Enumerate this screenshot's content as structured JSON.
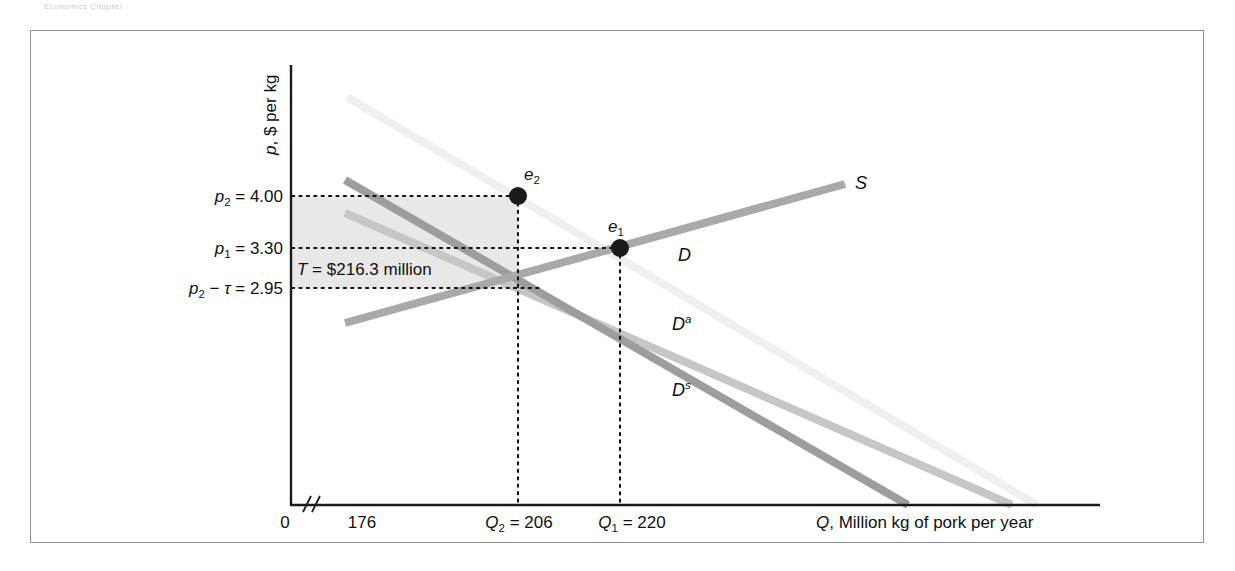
{
  "page": {
    "header_faint_text": "Economics  Chapter"
  },
  "chart_data": {
    "type": "line",
    "title": "",
    "xlabel": "Q, Million kg of pork per year",
    "ylabel": "p, $ per kg",
    "grid": false,
    "legend_position": "inline-curve-labels",
    "x_ticks": [
      {
        "label": "0",
        "value": 0
      },
      {
        "label": "176",
        "value": 176
      },
      {
        "label": "Q₂ = 206",
        "value": 206
      },
      {
        "label": "Q₁ = 220",
        "value": 220
      }
    ],
    "x_axis_break": true,
    "y_ticks": [
      {
        "label": "p₂ = 4.00",
        "value": 4.0
      },
      {
        "label": "p₁ = 3.30",
        "value": 3.3
      },
      {
        "label": "p₂ − τ = 2.95",
        "value": 2.95
      }
    ],
    "annotations": [
      {
        "name": "tax-revenue",
        "text": "T = $216.3 million",
        "value": 216.3,
        "units": "million dollars"
      },
      {
        "name": "equilibrium-2",
        "text": "e₂",
        "x": 206,
        "y": 4.0
      },
      {
        "name": "equilibrium-1",
        "text": "e₁",
        "x": 220,
        "y": 3.3
      }
    ],
    "series": [
      {
        "name": "S",
        "label": "S",
        "role": "supply",
        "color": "#a9a9a9",
        "points": [
          [
            176,
            2.62
          ],
          [
            292,
            4.16
          ]
        ]
      },
      {
        "name": "D",
        "label": "D",
        "role": "total-demand",
        "color": "#efefef",
        "points": [
          [
            182,
            5.22
          ],
          [
            360,
            1.05
          ]
        ]
      },
      {
        "name": "Da",
        "label": "D",
        "superscript": "a",
        "role": "domestic-demand",
        "color": "#c6c6c6",
        "points": [
          [
            176,
            4.26
          ],
          [
            350,
            1.05
          ]
        ]
      },
      {
        "name": "Ds",
        "label": "D",
        "superscript": "s",
        "role": "supply-shifted-demand",
        "color": "#9d9d9d",
        "points": [
          [
            176,
            4.38
          ],
          [
            285,
            1.05
          ]
        ]
      }
    ],
    "curve_labels": [
      {
        "name": "S",
        "text": "S"
      },
      {
        "name": "D",
        "text": "D"
      },
      {
        "name": "Da",
        "text": "D",
        "sup": "a"
      },
      {
        "name": "Ds",
        "text": "D",
        "sup": "s"
      }
    ],
    "colors": {
      "supply": "#a9a9a9",
      "demand_total": "#efefef",
      "demand_a": "#c6c6c6",
      "demand_s": "#9d9d9d",
      "tax_shade": "#e8e8e8",
      "axis": "#1a1a1a",
      "frame": "#8d9095"
    }
  }
}
